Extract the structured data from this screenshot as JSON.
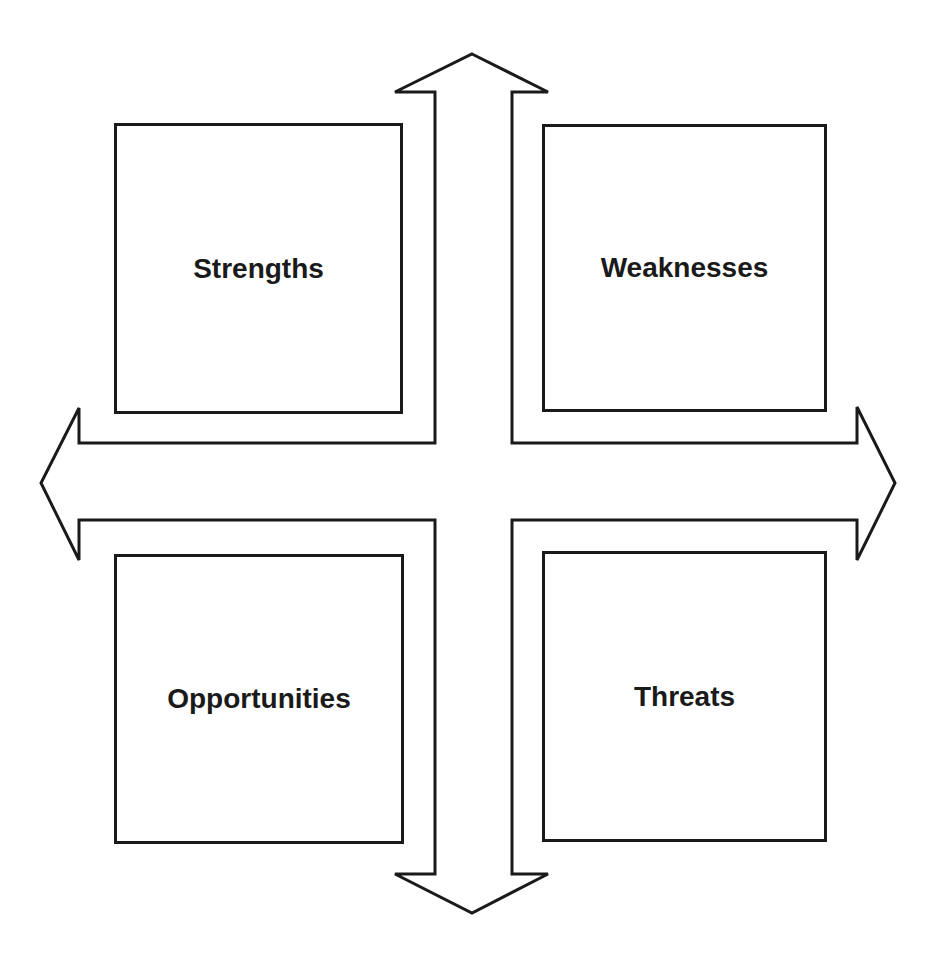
{
  "diagram": {
    "type": "SWOT quadrant with four-way arrow",
    "quadrants": [
      {
        "position": "top-left",
        "label": "Strengths"
      },
      {
        "position": "top-right",
        "label": "Weaknesses"
      },
      {
        "position": "bottom-left",
        "label": "Opportunities"
      },
      {
        "position": "bottom-right",
        "label": "Threats"
      }
    ],
    "arrows": [
      "up",
      "down",
      "left",
      "right"
    ],
    "colors": {
      "stroke": "#1a1a1a",
      "fill": "#ffffff"
    }
  }
}
